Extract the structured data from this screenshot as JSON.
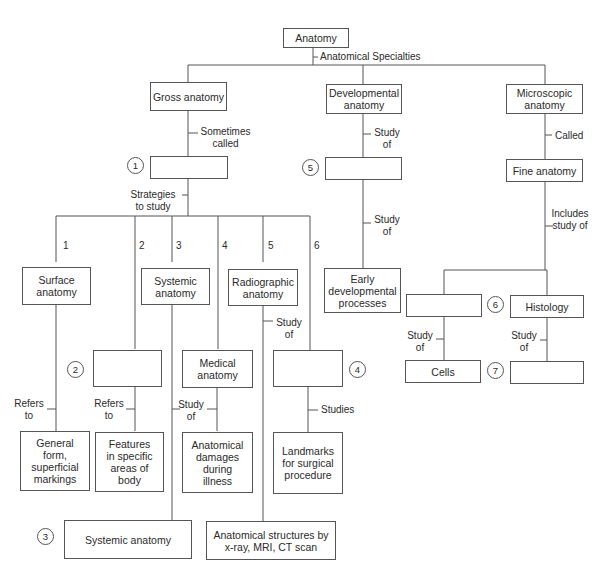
{
  "diagram": {
    "root": "Anatomy",
    "root_edge": "Anatomical Specialties",
    "gross": {
      "label": "Gross anatomy",
      "edge_called": "Sometimes called",
      "blank_1": "",
      "edge_strategies": "Strategies to study",
      "branches": [
        {
          "num": "1",
          "label": "Surface anatomy",
          "edge": "Refers to",
          "target": "General form, superficial markings"
        },
        {
          "num": "2",
          "label": "",
          "edge": "Refers to",
          "target": "Features in specific areas of body"
        },
        {
          "num": "3",
          "label": "Systemic anatomy",
          "edge": "",
          "target": ""
        },
        {
          "num": "4",
          "label": "Medical anatomy",
          "edge": "Study of",
          "target": "Anatomical damages during illness"
        },
        {
          "num": "5",
          "label": "Radiographic anatomy",
          "edge": "Study of",
          "target": "Anatomical structures by x-ray, MRI, CT scan"
        },
        {
          "num": "6",
          "label": "",
          "edge": "Studies",
          "target": "Landmarks for surgical procedure"
        }
      ]
    },
    "developmental": {
      "label": "Developmental anatomy",
      "edge1": "Study of",
      "blank_5": "",
      "edge2": "Study of",
      "target": "Early developmental processes"
    },
    "microscopic": {
      "label": "Microscopic anatomy",
      "edge_called": "Called",
      "fine": "Fine anatomy",
      "edge_includes": "Includes study of",
      "left_blank": "",
      "left_edge": "Study of",
      "left_target": "Cells",
      "right": "Histology",
      "right_edge": "Study of",
      "right_target": ""
    },
    "circles": [
      "1",
      "2",
      "3",
      "4",
      "5",
      "6",
      "7"
    ]
  }
}
